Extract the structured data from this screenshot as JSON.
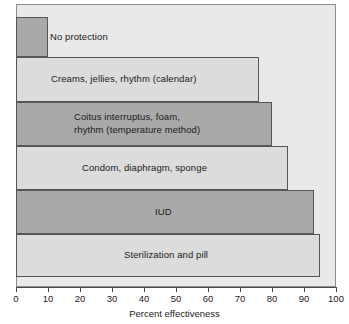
{
  "chart_data": {
    "type": "bar",
    "orientation": "horizontal",
    "title": "",
    "xlabel": "Percent effectiveness",
    "ylabel": "",
    "xlim": [
      0,
      100
    ],
    "ylim": null,
    "grid": false,
    "legend": null,
    "xticks": [
      0,
      10,
      20,
      30,
      40,
      50,
      60,
      70,
      80,
      90,
      100
    ],
    "xtick_labels": [
      "0",
      "10",
      "20",
      "30",
      "40",
      "50",
      "60",
      "70",
      "80",
      "90",
      "100"
    ],
    "categories": [
      "No protection",
      "Creams, jellies, rhythm (calendar)",
      "Coitus interruptus, foam,\nrhythm (temperature method)",
      "Condom, diaphragm, sponge",
      "IUD",
      "Sterilization and pill"
    ],
    "values": [
      10,
      76,
      80,
      85,
      93,
      95
    ],
    "bar_colors": [
      "#a9a9a9",
      "#dcdcdc",
      "#a9a9a9",
      "#dcdcdc",
      "#a9a9a9",
      "#dcdcdc"
    ],
    "plot_background": "#e9e9e9",
    "bar_border_color": "#565656",
    "axis_color": "#4a4a4a",
    "text_color": "#1b1b1b"
  },
  "bars": [
    {
      "label": "No protection",
      "value": 10,
      "color": "#a9a9a9",
      "top": 17,
      "height": 40,
      "label_left": 50,
      "label_top": 31,
      "lines": 1
    },
    {
      "label": "Creams, jellies, rhythm (calendar)",
      "value": 76,
      "color": "#dcdcdc",
      "top": 57,
      "height": 45,
      "label_left": 51,
      "label_top": 73,
      "lines": 1
    },
    {
      "label": "Coitus interruptus, foam,\nrhythm (temperature method)",
      "value": 80,
      "color": "#a9a9a9",
      "top": 102,
      "height": 44,
      "label_left": 74,
      "label_top": 111,
      "lines": 2
    },
    {
      "label": "Condom, diaphragm, sponge",
      "value": 85,
      "color": "#dcdcdc",
      "top": 146,
      "height": 44,
      "label_left": 82,
      "label_top": 162,
      "lines": 1
    },
    {
      "label": "IUD",
      "value": 93,
      "color": "#a9a9a9",
      "top": 190,
      "height": 44,
      "label_left": 155,
      "label_top": 206,
      "lines": 1
    },
    {
      "label": "Sterilization and pill",
      "value": 95,
      "color": "#dcdcdc",
      "top": 234,
      "height": 43,
      "label_left": 124,
      "label_top": 249,
      "lines": 1
    }
  ],
  "axis": {
    "title": "Percent effectiveness",
    "ticks": [
      {
        "value": "0",
        "x": 16
      },
      {
        "value": "10",
        "x": 48
      },
      {
        "value": "20",
        "x": 80
      },
      {
        "value": "30",
        "x": 112
      },
      {
        "value": "40",
        "x": 144
      },
      {
        "value": "50",
        "x": 176
      },
      {
        "value": "60",
        "x": 208
      },
      {
        "value": "70",
        "x": 240
      },
      {
        "value": "80",
        "x": 272
      },
      {
        "value": "90",
        "x": 304
      },
      {
        "value": "100",
        "x": 336
      }
    ]
  }
}
